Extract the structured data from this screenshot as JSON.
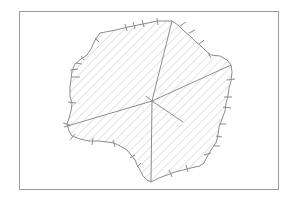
{
  "diagram": {
    "type": "hatched-region-with-radial-lines",
    "frame": {
      "x": 19,
      "y": 11,
      "width": 259,
      "height": 178,
      "stroke": "#9a9a9a"
    },
    "region": {
      "fill_pattern": "diagonal-hatch",
      "hatch_color": "#c8c8c8",
      "outline_color": "#8c8c8c",
      "outline": [
        [
          100,
          33
        ],
        [
          116,
          30
        ],
        [
          128,
          27
        ],
        [
          143,
          24
        ],
        [
          157,
          21
        ],
        [
          172,
          21
        ],
        [
          178,
          25
        ],
        [
          184,
          31
        ],
        [
          190,
          36
        ],
        [
          195,
          41
        ],
        [
          201,
          46
        ],
        [
          206,
          51
        ],
        [
          211,
          55
        ],
        [
          220,
          56
        ],
        [
          227,
          60
        ],
        [
          231,
          65
        ],
        [
          232,
          72
        ],
        [
          231,
          81
        ],
        [
          229,
          88
        ],
        [
          228,
          96
        ],
        [
          226,
          103
        ],
        [
          225,
          111
        ],
        [
          222,
          119
        ],
        [
          219,
          127
        ],
        [
          218,
          135
        ],
        [
          216,
          143
        ],
        [
          211,
          150
        ],
        [
          207,
          157
        ],
        [
          204,
          163
        ],
        [
          200,
          166
        ],
        [
          191,
          168
        ],
        [
          183,
          170
        ],
        [
          175,
          172
        ],
        [
          167,
          175
        ],
        [
          159,
          178
        ],
        [
          151,
          182
        ],
        [
          147,
          180
        ],
        [
          143,
          176
        ],
        [
          140,
          170
        ],
        [
          137,
          165
        ],
        [
          135,
          160
        ],
        [
          131,
          155
        ],
        [
          127,
          150
        ],
        [
          120,
          146
        ],
        [
          114,
          143
        ],
        [
          107,
          142
        ],
        [
          98,
          141
        ],
        [
          89,
          141
        ],
        [
          80,
          139
        ],
        [
          72,
          136
        ],
        [
          69,
          131
        ],
        [
          67,
          124
        ],
        [
          69,
          118
        ],
        [
          71,
          111
        ],
        [
          72,
          104
        ],
        [
          70,
          96
        ],
        [
          70,
          87
        ],
        [
          71,
          79
        ],
        [
          72,
          71
        ],
        [
          75,
          64
        ],
        [
          81,
          59
        ],
        [
          87,
          55
        ],
        [
          91,
          49
        ],
        [
          94,
          42
        ],
        [
          97,
          37
        ]
      ]
    },
    "center": {
      "x": 152,
      "y": 101
    },
    "spokes": [
      {
        "to": [
          172,
          21
        ]
      },
      {
        "to": [
          231,
          65
        ]
      },
      {
        "to": [
          64,
          127
        ]
      },
      {
        "to": [
          151,
          182
        ]
      },
      {
        "to": [
          183,
          122
        ]
      }
    ],
    "center_tick": {
      "from": [
        146,
        96
      ],
      "to": [
        152,
        101
      ]
    },
    "tick_marks": [
      [
        [
          125,
          24
        ],
        [
          127,
          31
        ]
      ],
      [
        [
          133,
          22
        ],
        [
          135,
          29
        ]
      ],
      [
        [
          142,
          20
        ],
        [
          144,
          27
        ]
      ],
      [
        [
          157,
          18
        ],
        [
          158,
          25
        ]
      ],
      [
        [
          180,
          26
        ],
        [
          186,
          22
        ]
      ],
      [
        [
          189,
          33
        ],
        [
          195,
          30
        ]
      ],
      [
        [
          199,
          44
        ],
        [
          204,
          40
        ]
      ],
      [
        [
          203,
          48
        ],
        [
          207,
          52
        ]
      ],
      [
        [
          208,
          53
        ],
        [
          211,
          58
        ]
      ],
      [
        [
          227,
          80
        ],
        [
          235,
          79
        ]
      ],
      [
        [
          224,
          97
        ],
        [
          232,
          97
        ]
      ],
      [
        [
          223,
          107
        ],
        [
          231,
          108
        ]
      ],
      [
        [
          219,
          124
        ],
        [
          226,
          124
        ]
      ],
      [
        [
          216,
          136
        ],
        [
          222,
          137
        ]
      ],
      [
        [
          213,
          146
        ],
        [
          220,
          146
        ]
      ],
      [
        [
          204,
          155
        ],
        [
          211,
          153
        ]
      ],
      [
        [
          186,
          165
        ],
        [
          188,
          172
        ]
      ],
      [
        [
          169,
          170
        ],
        [
          172,
          177
        ]
      ],
      [
        [
          141,
          163
        ],
        [
          137,
          167
        ]
      ],
      [
        [
          135,
          155
        ],
        [
          130,
          158
        ]
      ],
      [
        [
          113,
          140
        ],
        [
          115,
          147
        ]
      ],
      [
        [
          93,
          138
        ],
        [
          92,
          145
        ]
      ],
      [
        [
          75,
          134
        ],
        [
          70,
          140
        ]
      ],
      [
        [
          63,
          123
        ],
        [
          70,
          125
        ]
      ],
      [
        [
          68,
          102
        ],
        [
          76,
          103
        ]
      ],
      [
        [
          72,
          77
        ],
        [
          80,
          77
        ]
      ],
      [
        [
          70,
          70
        ],
        [
          78,
          69
        ]
      ],
      [
        [
          76,
          63
        ],
        [
          82,
          64
        ]
      ],
      [
        [
          81,
          56
        ],
        [
          84,
          60
        ]
      ],
      [
        [
          95,
          38
        ],
        [
          99,
          42
        ]
      ]
    ]
  }
}
